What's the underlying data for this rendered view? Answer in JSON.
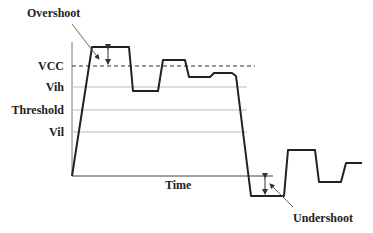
{
  "diagram": {
    "labels": {
      "overshoot": "Overshoot",
      "undershoot": "Undershoot",
      "vcc": "VCC",
      "vih": "Vih",
      "threshold": "Threshold",
      "vil": "Vil",
      "time": "Time"
    },
    "levels": {
      "vcc_y": 66,
      "vih_y": 87,
      "threshold_y": 110,
      "vil_y": 132,
      "ground_y": 176
    },
    "colors": {
      "signal": "#222222",
      "grid": "#bbbbbb",
      "vcc_dash": "#333333",
      "text": "#222222"
    },
    "waveform_points": [
      [
        72,
        176
      ],
      [
        92,
        47
      ],
      [
        129,
        47
      ],
      [
        133,
        91
      ],
      [
        158,
        91
      ],
      [
        163,
        60
      ],
      [
        185,
        60
      ],
      [
        189,
        77
      ],
      [
        210,
        77
      ],
      [
        214,
        73
      ],
      [
        232,
        73
      ],
      [
        236,
        76
      ],
      [
        251,
        196
      ],
      [
        284,
        196
      ],
      [
        288,
        150
      ],
      [
        315,
        150
      ],
      [
        319,
        182
      ],
      [
        341,
        182
      ],
      [
        346,
        163
      ],
      [
        362,
        163
      ]
    ]
  }
}
